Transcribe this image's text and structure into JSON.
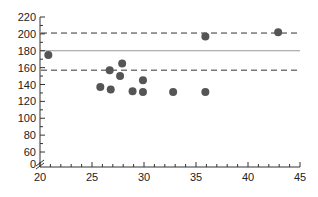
{
  "chart_data": {
    "type": "scatter",
    "title": "",
    "xlabel": "",
    "ylabel": "",
    "xlim": [
      20,
      45
    ],
    "ylim": [
      0,
      220
    ],
    "y_axis_break": true,
    "x_ticks": [
      20,
      25,
      30,
      35,
      40,
      45
    ],
    "y_ticks": [
      0,
      60,
      80,
      100,
      120,
      140,
      160,
      180,
      200,
      220
    ],
    "grid": false,
    "points": [
      {
        "x": 20.8,
        "y": 175
      },
      {
        "x": 25.8,
        "y": 137
      },
      {
        "x": 26.7,
        "y": 157
      },
      {
        "x": 26.8,
        "y": 134
      },
      {
        "x": 27.7,
        "y": 150
      },
      {
        "x": 27.9,
        "y": 165
      },
      {
        "x": 28.9,
        "y": 132
      },
      {
        "x": 29.9,
        "y": 145
      },
      {
        "x": 29.9,
        "y": 131
      },
      {
        "x": 32.8,
        "y": 131
      },
      {
        "x": 35.9,
        "y": 131
      },
      {
        "x": 35.9,
        "y": 197
      },
      {
        "x": 42.9,
        "y": 202
      }
    ],
    "reference_lines": [
      {
        "name": "mean",
        "y": 180,
        "style": "solid"
      },
      {
        "name": "upper",
        "y": 201,
        "style": "dashed"
      },
      {
        "name": "lower",
        "y": 157,
        "style": "dashed"
      }
    ],
    "colors": {
      "points": "#555555",
      "axis": "#333333",
      "mean_line": "#999999",
      "limit_line": "#333333"
    }
  }
}
